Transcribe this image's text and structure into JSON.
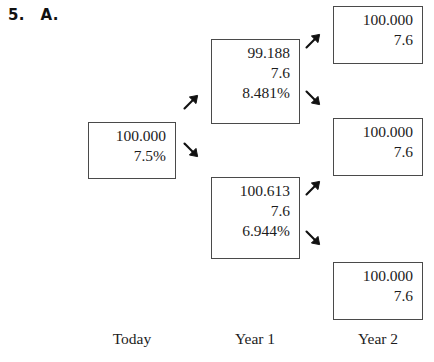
{
  "header": {
    "question_number": "5.",
    "part_label": "A."
  },
  "tree": {
    "root": {
      "name": "today-node",
      "lines": [
        "100.000",
        "7.5%"
      ]
    },
    "year1": [
      {
        "name": "year1-up-node",
        "lines": [
          "99.188",
          "7.6",
          "8.481%"
        ]
      },
      {
        "name": "year1-down-node",
        "lines": [
          "100.613",
          "7.6",
          "6.944%"
        ]
      }
    ],
    "year2": [
      {
        "name": "year2-upper-node",
        "lines": [
          "100.000",
          "7.6"
        ]
      },
      {
        "name": "year2-middle-node",
        "lines": [
          "100.000",
          "7.6"
        ]
      },
      {
        "name": "year2-lower-node",
        "lines": [
          "100.000",
          "7.6"
        ]
      }
    ]
  },
  "arrows": [
    {
      "name": "arrow-today-to-year1-up",
      "direction": "up-right"
    },
    {
      "name": "arrow-today-to-year1-down",
      "direction": "down-right"
    },
    {
      "name": "arrow-year1up-to-year2-upper",
      "direction": "up-right"
    },
    {
      "name": "arrow-year1up-to-year2-middle",
      "direction": "down-right"
    },
    {
      "name": "arrow-year1down-to-year2-middle",
      "direction": "up-right"
    },
    {
      "name": "arrow-year1down-to-year2-lower",
      "direction": "down-right"
    }
  ],
  "column_labels": {
    "today": "Today",
    "year1": "Year 1",
    "year2": "Year 2"
  },
  "colors": {
    "background": "#ffffff",
    "box_border": "#4a4a4a",
    "text": "#1c1c1c",
    "arrow": "#111111"
  }
}
